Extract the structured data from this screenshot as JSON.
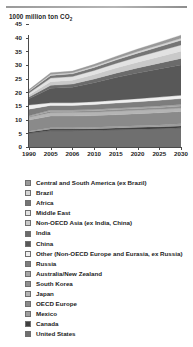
{
  "chart_data": {
    "type": "area",
    "stacked": true,
    "title": "",
    "ylabel": "1000 million ton CO2",
    "ylabel_display": "1000 million ton CO",
    "ylabel_sub": "2",
    "xlabel": "",
    "ylim": [
      0,
      45
    ],
    "yticks": [
      0,
      5,
      10,
      15,
      20,
      25,
      30,
      35,
      40,
      45
    ],
    "grid": false,
    "legend_position": "below",
    "categories": [
      "1990",
      "2005",
      "2006",
      "2010",
      "2015",
      "2020",
      "2025",
      "2030"
    ],
    "series": [
      {
        "name": "United States",
        "color": "#6f6f6f",
        "values": [
          5.0,
          6.0,
          6.0,
          6.1,
          6.3,
          6.5,
          6.7,
          7.0
        ]
      },
      {
        "name": "Canada",
        "color": "#3f3f3f",
        "values": [
          0.45,
          0.6,
          0.6,
          0.62,
          0.65,
          0.68,
          0.7,
          0.72
        ]
      },
      {
        "name": "Mexico",
        "color": "#9e9e9e",
        "values": [
          0.3,
          0.42,
          0.43,
          0.47,
          0.53,
          0.6,
          0.67,
          0.75
        ]
      },
      {
        "name": "OECD Europe",
        "color": "#8a8a8a",
        "values": [
          4.1,
          4.3,
          4.3,
          4.3,
          4.35,
          4.4,
          4.45,
          4.5
        ]
      },
      {
        "name": "Japan",
        "color": "#b4b4b4",
        "values": [
          1.05,
          1.25,
          1.25,
          1.25,
          1.25,
          1.25,
          1.25,
          1.25
        ]
      },
      {
        "name": "South Korea",
        "color": "#8f8f8f",
        "values": [
          0.25,
          0.5,
          0.5,
          0.55,
          0.6,
          0.65,
          0.7,
          0.75
        ]
      },
      {
        "name": "Australia/New Zealand",
        "color": "#a6a6a6",
        "values": [
          0.3,
          0.43,
          0.43,
          0.45,
          0.48,
          0.5,
          0.53,
          0.55
        ]
      },
      {
        "name": "Russia",
        "color": "#7d7d7d",
        "values": [
          2.4,
          1.7,
          1.7,
          1.8,
          1.9,
          2.0,
          2.1,
          2.2
        ]
      },
      {
        "name": "Other (Non-OECD Europe and Eurasia, ex Russia)",
        "color": "#efefef",
        "values": [
          1.5,
          0.95,
          0.95,
          1.0,
          1.05,
          1.1,
          1.15,
          1.2
        ]
      },
      {
        "name": "China",
        "color": "#585858",
        "values": [
          2.3,
          5.3,
          5.7,
          7.0,
          8.3,
          9.4,
          10.3,
          11.1
        ]
      },
      {
        "name": "India",
        "color": "#6b6b6b",
        "values": [
          0.6,
          1.1,
          1.15,
          1.35,
          1.6,
          1.85,
          2.1,
          2.4
        ]
      },
      {
        "name": "Non-OECD Asia (ex India, China)",
        "color": "#c9c9c9",
        "values": [
          0.8,
          1.35,
          1.4,
          1.6,
          1.85,
          2.1,
          2.35,
          2.6
        ]
      },
      {
        "name": "Middle East",
        "color": "#e2e2e2",
        "values": [
          0.7,
          1.3,
          1.35,
          1.5,
          1.7,
          1.9,
          2.1,
          2.3
        ]
      },
      {
        "name": "Africa",
        "color": "#757575",
        "values": [
          0.65,
          1.0,
          1.0,
          1.1,
          1.25,
          1.4,
          1.55,
          1.7
        ]
      },
      {
        "name": "Brazil",
        "color": "#d5d5d5",
        "values": [
          0.2,
          0.35,
          0.36,
          0.42,
          0.5,
          0.58,
          0.66,
          0.75
        ]
      },
      {
        "name": "Central and South America (ex Brazil)",
        "color": "#999999",
        "values": [
          0.4,
          0.62,
          0.64,
          0.72,
          0.82,
          0.93,
          1.04,
          1.15
        ]
      }
    ]
  },
  "legend": {
    "items": [
      {
        "label": "Central and South America (ex Brazil)",
        "color": "#999999"
      },
      {
        "label": "Brazil",
        "color": "#d5d5d5"
      },
      {
        "label": "Africa",
        "color": "#757575"
      },
      {
        "label": "Middle East",
        "color": "#e2e2e2"
      },
      {
        "label": "Non-OECD Asia (ex India, China)",
        "color": "#c9c9c9"
      },
      {
        "label": "India",
        "color": "#6b6b6b"
      },
      {
        "label": "China",
        "color": "#585858"
      },
      {
        "label": "Other (Non-OECD Europe and Eurasia, ex Russia)",
        "color": "#efefef"
      },
      {
        "label": "Russia",
        "color": "#7d7d7d"
      },
      {
        "label": "Australia/New Zealand",
        "color": "#a6a6a6"
      },
      {
        "label": "South Korea",
        "color": "#8f8f8f"
      },
      {
        "label": "Japan",
        "color": "#b4b4b4"
      },
      {
        "label": "OECD Europe",
        "color": "#8a8a8a"
      },
      {
        "label": "Mexico",
        "color": "#9e9e9e"
      },
      {
        "label": "Canada",
        "color": "#3f3f3f"
      },
      {
        "label": "United States",
        "color": "#6f6f6f"
      }
    ]
  }
}
